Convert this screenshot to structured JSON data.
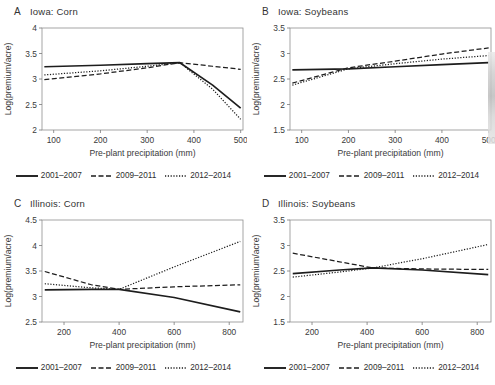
{
  "figure": {
    "shared_xlabel": "Pre-plant precipitation (mm)",
    "shared_ylabel": "Log(premium/acre)",
    "legend": [
      {
        "label": "2001–2007",
        "style": "solid"
      },
      {
        "label": "2009–2011",
        "style": "dashed"
      },
      {
        "label": "2012–2014",
        "style": "dotted"
      }
    ]
  },
  "panels": [
    {
      "letter": "A",
      "title": "Iowa: Corn"
    },
    {
      "letter": "B",
      "title": "Iowa: Soybeans"
    },
    {
      "letter": "C",
      "title": "Illinois: Corn"
    },
    {
      "letter": "D",
      "title": "Illinois: Soybeans"
    }
  ],
  "chart_data": [
    {
      "id": "A",
      "type": "line",
      "title": "Iowa: Corn",
      "panel_letter": "A",
      "xlabel": "Pre-plant precipitation (mm)",
      "ylabel": "Log(premium/acre)",
      "xlim": [
        75,
        505
      ],
      "ylim": [
        2,
        4
      ],
      "xticks": [
        100,
        200,
        300,
        400,
        500
      ],
      "yticks": [
        2,
        2.5,
        3,
        3.5,
        4
      ],
      "grid": false,
      "legend_position": "below",
      "series": [
        {
          "name": "2001–2007",
          "style": "solid",
          "x": [
            80,
            200,
            300,
            370,
            440,
            500
          ],
          "y": [
            3.24,
            3.27,
            3.3,
            3.32,
            2.88,
            2.43
          ]
        },
        {
          "name": "2009–2011",
          "style": "dashed",
          "x": [
            80,
            200,
            300,
            370,
            440,
            500
          ],
          "y": [
            2.99,
            3.1,
            3.22,
            3.32,
            3.25,
            3.19
          ]
        },
        {
          "name": "2012–2014",
          "style": "dotted",
          "x": [
            80,
            200,
            300,
            370,
            440,
            500
          ],
          "y": [
            3.08,
            3.16,
            3.25,
            3.32,
            2.8,
            2.21
          ]
        }
      ]
    },
    {
      "id": "B",
      "type": "line",
      "title": "Iowa: Soybeans",
      "panel_letter": "B",
      "xlabel": "Pre-plant precipitation (mm)",
      "ylabel": "Log(premium/acre)",
      "xlim": [
        75,
        505
      ],
      "ylim": [
        1.5,
        3.5
      ],
      "xticks": [
        100,
        200,
        300,
        400,
        500
      ],
      "yticks": [
        1.5,
        2,
        2.5,
        3,
        3.5
      ],
      "grid": false,
      "legend_position": "below",
      "series": [
        {
          "name": "2001–2007",
          "style": "solid",
          "x": [
            80,
            200,
            300,
            400,
            500
          ],
          "y": [
            2.68,
            2.7,
            2.74,
            2.78,
            2.82
          ]
        },
        {
          "name": "2009–2011",
          "style": "dashed",
          "x": [
            80,
            200,
            300,
            400,
            500
          ],
          "y": [
            2.42,
            2.72,
            2.85,
            2.99,
            3.11
          ]
        },
        {
          "name": "2012–2014",
          "style": "dotted",
          "x": [
            80,
            200,
            300,
            400,
            500
          ],
          "y": [
            2.38,
            2.7,
            2.8,
            2.89,
            2.96
          ]
        }
      ]
    },
    {
      "id": "C",
      "type": "line",
      "title": "Illinois: Corn",
      "panel_letter": "C",
      "xlabel": "Pre-plant precipitation (mm)",
      "ylabel": "Log(premium/acre)",
      "xlim": [
        120,
        850
      ],
      "ylim": [
        2.5,
        4.5
      ],
      "xticks": [
        200,
        400,
        600,
        800
      ],
      "yticks": [
        2.5,
        3,
        3.5,
        4,
        4.5
      ],
      "grid": false,
      "legend_position": "below",
      "series": [
        {
          "name": "2001–2007",
          "style": "solid",
          "x": [
            130,
            300,
            400,
            600,
            840
          ],
          "y": [
            3.13,
            3.14,
            3.14,
            2.98,
            2.7
          ]
        },
        {
          "name": "2009–2011",
          "style": "dashed",
          "x": [
            130,
            300,
            400,
            600,
            840
          ],
          "y": [
            3.49,
            3.23,
            3.14,
            3.19,
            3.23
          ]
        },
        {
          "name": "2012–2014",
          "style": "dotted",
          "x": [
            130,
            300,
            400,
            600,
            840
          ],
          "y": [
            3.25,
            3.17,
            3.14,
            3.58,
            4.08
          ]
        }
      ]
    },
    {
      "id": "D",
      "type": "line",
      "title": "Illinois: Soybeans",
      "panel_letter": "D",
      "xlabel": "Pre-plant precipitation (mm)",
      "ylabel": "Log(premium/acre)",
      "xlim": [
        120,
        850
      ],
      "ylim": [
        1.5,
        3.5
      ],
      "xticks": [
        200,
        400,
        600,
        800
      ],
      "yticks": [
        1.5,
        2,
        2.5,
        3,
        3.5
      ],
      "grid": false,
      "legend_position": "below",
      "series": [
        {
          "name": "2001–2007",
          "style": "solid",
          "x": [
            130,
            300,
            420,
            600,
            840
          ],
          "y": [
            2.45,
            2.52,
            2.56,
            2.52,
            2.43
          ]
        },
        {
          "name": "2009–2011",
          "style": "dashed",
          "x": [
            130,
            300,
            420,
            600,
            840
          ],
          "y": [
            2.85,
            2.68,
            2.56,
            2.54,
            2.53
          ]
        },
        {
          "name": "2012–2014",
          "style": "dotted",
          "x": [
            130,
            300,
            420,
            600,
            840
          ],
          "y": [
            2.38,
            2.48,
            2.56,
            2.74,
            3.02
          ]
        }
      ]
    }
  ]
}
